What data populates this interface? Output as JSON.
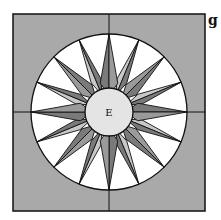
{
  "figure_label": "g",
  "center_label": "E",
  "colors": {
    "background": "#a9a9a9",
    "ring": "#ffffff",
    "dark_point": "#7a7a7a",
    "mid_point": "#9a9a9a",
    "light_point": "#c8c8c8",
    "center": "#e4e4e4",
    "stroke": "#111111"
  },
  "geometry": {
    "square": {
      "x": 13,
      "y": 14,
      "w": 192,
      "h": 197
    },
    "center": {
      "cx": 109,
      "cy": 112
    },
    "outer_radius": 78,
    "inner_radius": 24,
    "points": 16
  }
}
